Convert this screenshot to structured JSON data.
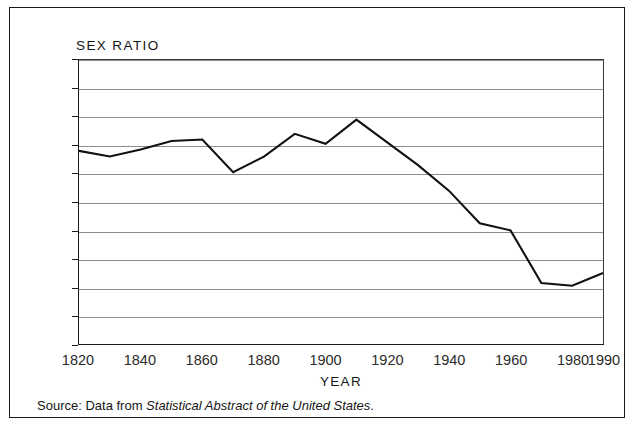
{
  "figure": {
    "source_note_prefix": "Source: Data from ",
    "source_note_title": "Statistical Abstract of the United States",
    "source_note_suffix": "."
  },
  "chart_data": {
    "type": "line",
    "title": "SEX RATIO",
    "xlabel": "YEAR",
    "ylabel": "",
    "xlim": [
      1820,
      1990
    ],
    "ylim": [
      90,
      110
    ],
    "xticks": [
      1820,
      1840,
      1860,
      1880,
      1900,
      1920,
      1940,
      1960,
      1980,
      1990
    ],
    "xtick_labels": [
      "1820",
      "1840",
      "1860",
      "1880",
      "1900",
      "1920",
      "1940",
      "1960",
      "1980",
      "1990"
    ],
    "yticks": [
      90,
      92,
      94,
      96,
      98,
      100,
      102,
      104,
      106,
      108,
      110
    ],
    "ytick_labels": [
      "90",
      "92",
      "94",
      "96",
      "98",
      "100",
      "102",
      "104",
      "106",
      "108",
      "110"
    ],
    "grid": "horizontal",
    "legend": "none",
    "line_color": "#111111",
    "x": [
      1820,
      1830,
      1840,
      1850,
      1860,
      1870,
      1880,
      1890,
      1900,
      1910,
      1920,
      1930,
      1940,
      1950,
      1960,
      1970,
      1980,
      1990
    ],
    "values": [
      103.6,
      103.2,
      103.7,
      104.3,
      104.4,
      102.1,
      103.2,
      104.8,
      104.1,
      105.8,
      104.2,
      102.6,
      100.8,
      98.5,
      98.0,
      94.3,
      94.1,
      95.0
    ],
    "series": [
      {
        "name": "Sex ratio",
        "values": [
          103.6,
          103.2,
          103.7,
          104.3,
          104.4,
          102.1,
          103.2,
          104.8,
          104.1,
          105.8,
          104.2,
          102.6,
          100.8,
          98.5,
          98.0,
          94.3,
          94.1,
          95.0
        ]
      }
    ]
  }
}
